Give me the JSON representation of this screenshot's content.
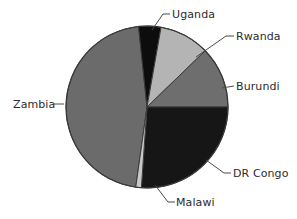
{
  "chart_data": {
    "type": "pie",
    "title": "",
    "subtitle": "",
    "xlabel": "",
    "ylabel": "",
    "legend_position": "none",
    "grid": false,
    "labels_placement": "outside-with-leader-lines",
    "categories": [
      "Uganda",
      "Rwanda",
      "Burundi",
      "DR Congo",
      "Malawi",
      "Zambia"
    ],
    "values": [
      4.4,
      10.0,
      12.2,
      26.1,
      1.1,
      46.2
    ],
    "unit": "percent",
    "slices": [
      {
        "label": "Uganda",
        "value": 4.4,
        "start_angle": 354,
        "end_angle": 370,
        "sweep": 16,
        "color": "#0d0d0d",
        "name": "slice-uganda"
      },
      {
        "label": "Rwanda",
        "value": 10.0,
        "start_angle": 10,
        "end_angle": 46,
        "sweep": 36,
        "color": "#b4b4b4",
        "name": "slice-rwanda"
      },
      {
        "label": "Burundi",
        "value": 12.2,
        "start_angle": 46,
        "end_angle": 90,
        "sweep": 44,
        "color": "#6e6e6e",
        "name": "slice-burundi"
      },
      {
        "label": "DR Congo",
        "value": 26.1,
        "start_angle": 90,
        "end_angle": 184,
        "sweep": 94,
        "color": "#161616",
        "name": "slice-dr-congo"
      },
      {
        "label": "Malawi",
        "value": 1.1,
        "start_angle": 184,
        "end_angle": 188,
        "sweep": 4,
        "color": "#c8c8c8",
        "name": "slice-malawi"
      },
      {
        "label": "Zambia",
        "value": 46.2,
        "start_angle": 188,
        "end_angle": 354,
        "sweep": 166,
        "color": "#6b6b6b",
        "name": "slice-zambia"
      }
    ],
    "geometry": {
      "center_x": 147,
      "center_y": 107,
      "radius": 81
    },
    "colors": {
      "background": "#ffffff",
      "outline": "#3a3a3a",
      "leader_line": "#4a4a4a",
      "label_text": "#2b2b2b"
    }
  },
  "labels": {
    "uganda": "Uganda",
    "rwanda": "Rwanda",
    "burundi": "Burundi",
    "dr_congo": "DR Congo",
    "malawi": "Malawi",
    "zambia": "Zambia"
  }
}
